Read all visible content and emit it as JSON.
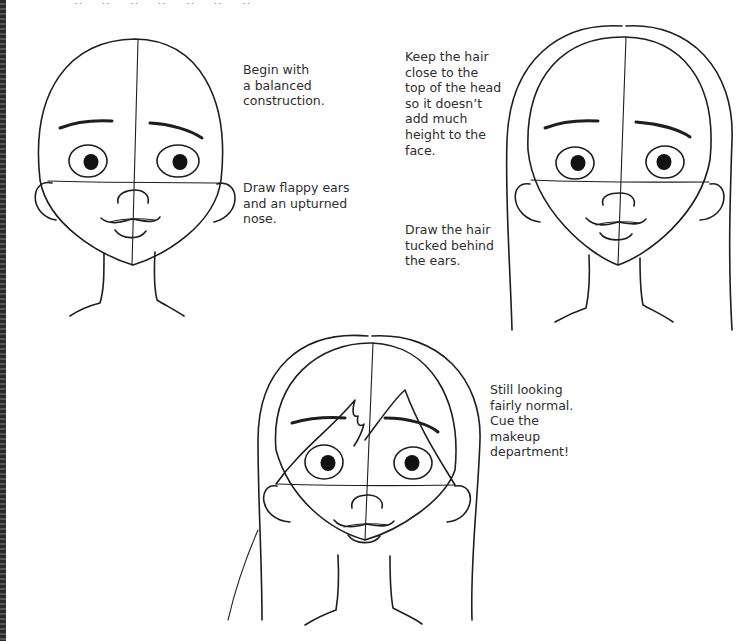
{
  "page": {
    "background": "#ffffff",
    "ink_color": "#1e1e1e",
    "cropped_heading_visible": true
  },
  "captions": {
    "step1_construction": "Begin with\na balanced\nconstruction.",
    "step1_ears_nose": "Draw flappy ears\nand an upturned\nnose.",
    "step2_hair_top": "Keep the hair\nclose to the\ntop of the head\nso it doesn’t\nadd much\nheight to the\nface.",
    "step2_hair_ears": "Draw the hair\ntucked behind\nthe ears.",
    "step3_bangs": "Still looking\nfairly normal.\nCue the\nmakeup\ndepartment!"
  },
  "illustrations": [
    {
      "name": "bald-head-construction",
      "features": [
        "guidelines",
        "eyebrows",
        "eyes",
        "ears",
        "nose",
        "mouth",
        "neck"
      ]
    },
    {
      "name": "head-with-hair-outline",
      "features": [
        "hair-outline",
        "guidelines",
        "eyebrows",
        "eyes",
        "ears",
        "nose",
        "mouth",
        "neck"
      ]
    },
    {
      "name": "head-with-bangs",
      "features": [
        "hair-outline",
        "bangs",
        "guidelines",
        "eyebrows",
        "eyes",
        "ears",
        "nose",
        "mouth",
        "neck"
      ]
    }
  ]
}
